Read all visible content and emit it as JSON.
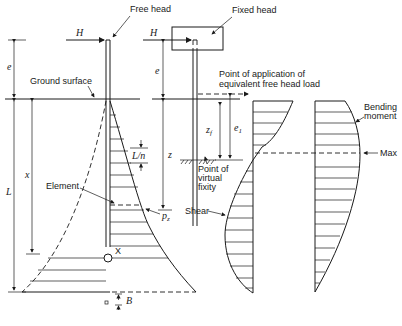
{
  "diagram": {
    "labels": {
      "free_head": "Free head",
      "fixed_head": "Fixed head",
      "ground_surface": "Ground surface",
      "point_of_application_line1": "Point of application of",
      "point_of_application_line2": "equivalent free head load",
      "bending_line1": "Bending",
      "bending_line2": "moment",
      "max": "Max",
      "element": "Element",
      "shear": "Shear",
      "virtual_line1": "Point of",
      "virtual_line2": "virtual",
      "virtual_line3": "fixity",
      "x_point": "X"
    },
    "symbols": {
      "H_left": "H",
      "H_right": "H",
      "e_left": "e",
      "e_right": "e",
      "L": "L",
      "x": "x",
      "L_over_n": "L/n",
      "z": "z",
      "z_f": "z",
      "z_f_sub": "f",
      "e_1": "e",
      "e_1_sub": "1",
      "p_z": "p",
      "p_z_sub": "z",
      "B": "B"
    }
  }
}
